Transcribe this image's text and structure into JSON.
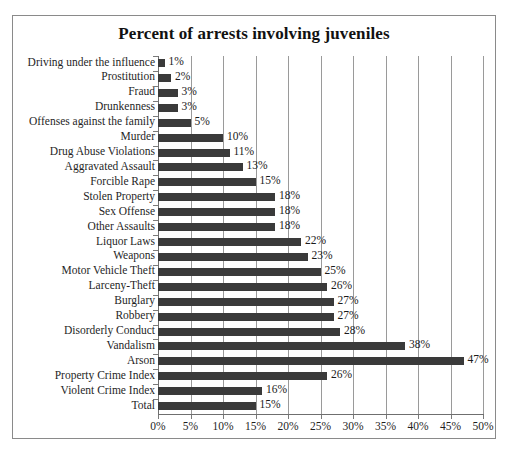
{
  "chart_data": {
    "type": "bar",
    "orientation": "horizontal",
    "title": "Percent of arrests involving juveniles",
    "xlabel": "",
    "ylabel": "",
    "xlim": [
      0,
      50
    ],
    "xtick_step": 5,
    "xticks": [
      "0%",
      "5%",
      "10%",
      "15%",
      "20%",
      "25%",
      "30%",
      "35%",
      "40%",
      "45%",
      "50%"
    ],
    "xtick_values": [
      0,
      5,
      10,
      15,
      20,
      25,
      30,
      35,
      40,
      45,
      50
    ],
    "grid": true,
    "legend": false,
    "bar_color": "#3a3a3a",
    "categories": [
      "Driving under the influence",
      "Prostitution",
      "Fraud",
      "Drunkenness",
      "Offenses against the family",
      "Murder",
      "Drug Abuse Violations",
      "Aggravated Assault",
      "Forcible Rape",
      "Stolen Property",
      "Sex Offense",
      "Other Assaults",
      "Liquor Laws",
      "Weapons",
      "Motor Vehicle Theft",
      "Larceny-Theft",
      "Burglary",
      "Robbery",
      "Disorderly Conduct",
      "Vandalism",
      "Arson",
      "Property Crime Index",
      "Violent Crime Index",
      "Total"
    ],
    "values": [
      1,
      2,
      3,
      3,
      5,
      10,
      11,
      13,
      15,
      18,
      18,
      18,
      22,
      23,
      25,
      26,
      27,
      27,
      28,
      38,
      47,
      26,
      16,
      15
    ],
    "data_labels": [
      "1%",
      "2%",
      "3%",
      "3%",
      "5%",
      "10%",
      "11%",
      "13%",
      "15%",
      "18%",
      "18%",
      "18%",
      "22%",
      "23%",
      "25%",
      "26%",
      "27%",
      "27%",
      "28%",
      "38%",
      "47%",
      "26%",
      "16%",
      "15%"
    ]
  }
}
